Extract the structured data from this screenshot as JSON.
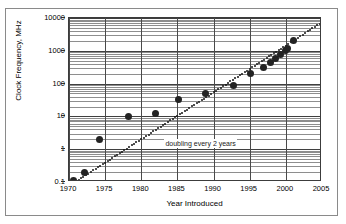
{
  "chart_data": {
    "type": "scatter",
    "title": "",
    "xlabel": "Year Introduced",
    "ylabel": "Clock Frequency, MHz",
    "xlim": [
      1970,
      2005
    ],
    "ylim": [
      0.1,
      10000
    ],
    "yscale": "log",
    "xticks": [
      "1970",
      "1975",
      "1980",
      "1985",
      "1990",
      "1995",
      "2000",
      "2005"
    ],
    "xtick_values": [
      1970,
      1975,
      1980,
      1985,
      1990,
      1995,
      2000,
      2005
    ],
    "yticks": [
      "10000",
      "1000",
      "100",
      "10",
      "1",
      "0.1"
    ],
    "ytick_values": [
      10000,
      1000,
      100,
      10,
      1,
      0.1
    ],
    "grid": "major-and-minor-horizontal, major-vertical",
    "legend": "none",
    "annotations": [
      {
        "text": "doubling every 2 years",
        "x": 1983.2,
        "y": 1.45
      }
    ],
    "series": [
      {
        "name": "Microprocessor clock frequency",
        "marker": "filled-circle",
        "color": "#232323",
        "points": [
          {
            "x": 1970.6,
            "y": 0.108
          },
          {
            "x": 1972.1,
            "y": 0.2
          },
          {
            "x": 1974.2,
            "y": 2.0
          },
          {
            "x": 1978.3,
            "y": 10.0
          },
          {
            "x": 1982.0,
            "y": 12.5
          },
          {
            "x": 1985.2,
            "y": 33.0
          },
          {
            "x": 1988.9,
            "y": 50.0
          },
          {
            "x": 1992.8,
            "y": 90.0
          },
          {
            "x": 1995.1,
            "y": 200.0
          },
          {
            "x": 1996.9,
            "y": 300.0
          },
          {
            "x": 1997.9,
            "y": 450.0
          },
          {
            "x": 1998.6,
            "y": 600.0
          },
          {
            "x": 1999.3,
            "y": 750.0
          },
          {
            "x": 1999.9,
            "y": 1000.0
          },
          {
            "x": 2000.2,
            "y": 1200.0
          },
          {
            "x": 2001.1,
            "y": 2000.0
          }
        ]
      },
      {
        "name": "doubling every 2 years",
        "marker": "dotted-line",
        "color": "#151515",
        "trend": {
          "x0": 1970.0,
          "y0": 0.075,
          "x1": 2005.0,
          "y1": 7500.0
        }
      }
    ]
  }
}
